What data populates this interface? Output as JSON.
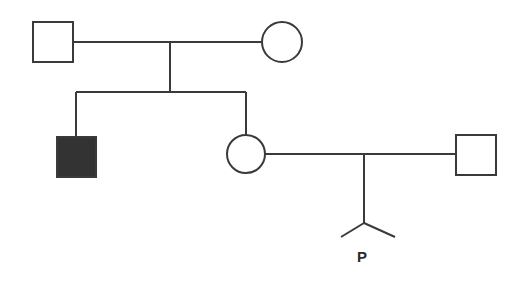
{
  "diagram": {
    "type": "pedigree",
    "colors": {
      "line": "#3a3a3a",
      "affected_fill": "#333333",
      "unaffected_fill": "#ffffff"
    },
    "individuals": [
      {
        "id": "I-1",
        "sex": "male",
        "affected": false,
        "generation": 1
      },
      {
        "id": "I-2",
        "sex": "female",
        "affected": false,
        "generation": 1
      },
      {
        "id": "II-1",
        "sex": "male",
        "affected": true,
        "generation": 2
      },
      {
        "id": "II-2",
        "sex": "female",
        "affected": false,
        "generation": 2
      },
      {
        "id": "II-3",
        "sex": "male",
        "affected": false,
        "generation": 2
      }
    ],
    "proband_label": "P"
  }
}
